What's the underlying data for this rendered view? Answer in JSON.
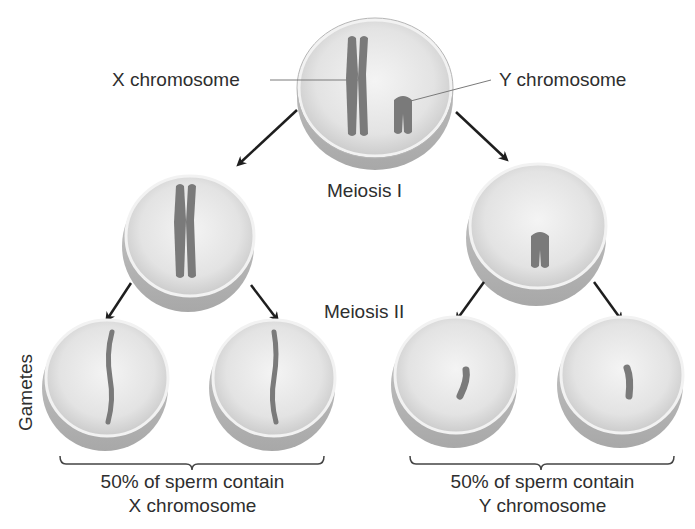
{
  "labels": {
    "x_chromosome": "X chromosome",
    "y_chromosome": "Y chromosome",
    "meiosis_1": "Meiosis I",
    "meiosis_2": "Meiosis II",
    "gametes": "Gametes",
    "left_summary_line1": "50% of sperm contain",
    "left_summary_line2": "X chromosome",
    "right_summary_line1": "50% of sperm contain",
    "right_summary_line2": "Y chromosome"
  },
  "cells": {
    "parent": "cell containing X and Y chromosomes",
    "meiosis1_left": "cell with X chromosome",
    "meiosis1_right": "cell with Y chromosome",
    "gametes": [
      "X gamete",
      "X gamete",
      "Y gamete",
      "Y gamete"
    ]
  },
  "colors": {
    "cell_fill": "#e6e6e6",
    "cell_rim": "#b8b8b8",
    "chromosome": "#7a7a7a",
    "arrow": "#1e1e1e",
    "text": "#2e2e2e"
  }
}
